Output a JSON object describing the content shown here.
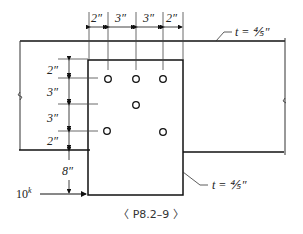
{
  "figure": {
    "caption": "〈 P8.2–9 〉",
    "top_dims": [
      "2″",
      "3″",
      "3″",
      "2″"
    ],
    "left_dims": [
      "2″",
      "3″",
      "3″",
      "2″"
    ],
    "load_offset": "8″",
    "load_label": "10",
    "load_unit": "k",
    "thickness_top": "t = ⅘″",
    "thickness_gusset": "t = ⅘″"
  }
}
